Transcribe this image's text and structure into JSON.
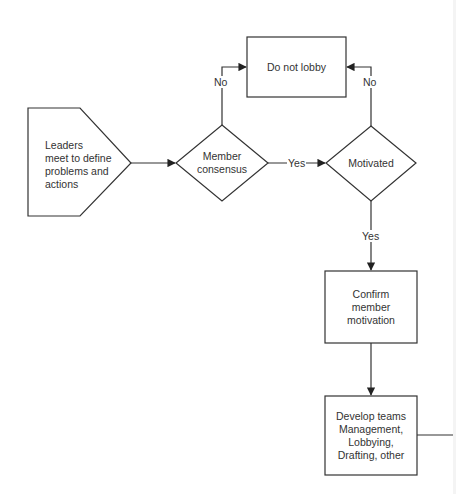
{
  "diagram": {
    "type": "flowchart",
    "colors": {
      "stroke": "#333333",
      "text": "#333333",
      "background": "#ffffff"
    },
    "nodes": [
      {
        "id": "start",
        "shape": "pentagon-arrow",
        "label_lines": [
          "Leaders",
          "meet to define",
          "problems and",
          "actions"
        ]
      },
      {
        "id": "consensus",
        "shape": "diamond",
        "label_lines": [
          "Member",
          "consensus"
        ]
      },
      {
        "id": "motivated",
        "shape": "diamond",
        "label_lines": [
          "Motivated"
        ]
      },
      {
        "id": "no_lobby",
        "shape": "rectangle",
        "label_lines": [
          "Do not lobby"
        ]
      },
      {
        "id": "confirm",
        "shape": "rectangle",
        "label_lines": [
          "Confirm",
          "member",
          "motivation"
        ]
      },
      {
        "id": "develop",
        "shape": "rectangle",
        "label_lines": [
          "Develop teams",
          "Management,",
          "Lobbying,",
          "Drafting, other"
        ]
      }
    ],
    "edges": [
      {
        "from": "start",
        "to": "consensus",
        "label": ""
      },
      {
        "from": "consensus",
        "to": "no_lobby",
        "label": "No"
      },
      {
        "from": "consensus",
        "to": "motivated",
        "label": "Yes"
      },
      {
        "from": "motivated",
        "to": "no_lobby",
        "label": "No"
      },
      {
        "from": "motivated",
        "to": "confirm",
        "label": "Yes"
      },
      {
        "from": "confirm",
        "to": "develop",
        "label": ""
      },
      {
        "from": "develop",
        "to": "offscreen-right",
        "label": ""
      }
    ]
  }
}
